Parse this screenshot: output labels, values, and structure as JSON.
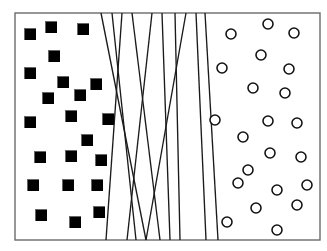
{
  "figure": {
    "title": "Linear separators between two classes",
    "background_color": "#ffffff",
    "frame": {
      "x": 15,
      "y": 13,
      "width": 305,
      "height": 227,
      "stroke_color": "#6b6b6b",
      "fill_color": "#ffffff"
    }
  },
  "chart_data": {
    "type": "scatter",
    "title": "Linear separators between two classes",
    "xlabel": "",
    "ylabel": "",
    "xlim": [
      0,
      327
    ],
    "ylim": [
      0,
      251
    ],
    "grid": false,
    "legend_position": "none",
    "annotations": [],
    "series": [
      {
        "name": "Class A (filled squares)",
        "marker": "square",
        "marker_size": 11,
        "fill_color": "#000000",
        "edge_color": "#000000",
        "count": 22,
        "points": [
          {
            "x": 30,
            "y": 34
          },
          {
            "x": 51,
            "y": 27
          },
          {
            "x": 83,
            "y": 29
          },
          {
            "x": 30,
            "y": 73
          },
          {
            "x": 63,
            "y": 82
          },
          {
            "x": 96,
            "y": 84
          },
          {
            "x": 48,
            "y": 98
          },
          {
            "x": 80,
            "y": 95
          },
          {
            "x": 30,
            "y": 122
          },
          {
            "x": 71,
            "y": 116
          },
          {
            "x": 108,
            "y": 119
          },
          {
            "x": 40,
            "y": 157
          },
          {
            "x": 71,
            "y": 156
          },
          {
            "x": 101,
            "y": 160
          },
          {
            "x": 33,
            "y": 185
          },
          {
            "x": 68,
            "y": 185
          },
          {
            "x": 97,
            "y": 185
          },
          {
            "x": 41,
            "y": 215
          },
          {
            "x": 75,
            "y": 222
          },
          {
            "x": 99,
            "y": 212
          },
          {
            "x": 54,
            "y": 56
          },
          {
            "x": 87,
            "y": 140
          }
        ]
      },
      {
        "name": "Class B (open circles)",
        "marker": "circle",
        "marker_size": 10,
        "fill_color": "#ffffff",
        "edge_color": "#111111",
        "count": 22,
        "points": [
          {
            "x": 231,
            "y": 34
          },
          {
            "x": 268,
            "y": 24
          },
          {
            "x": 294,
            "y": 33
          },
          {
            "x": 261,
            "y": 55
          },
          {
            "x": 222,
            "y": 68
          },
          {
            "x": 289,
            "y": 69
          },
          {
            "x": 253,
            "y": 88
          },
          {
            "x": 285,
            "y": 93
          },
          {
            "x": 215,
            "y": 120
          },
          {
            "x": 268,
            "y": 121
          },
          {
            "x": 297,
            "y": 123
          },
          {
            "x": 243,
            "y": 137
          },
          {
            "x": 270,
            "y": 153
          },
          {
            "x": 301,
            "y": 157
          },
          {
            "x": 238,
            "y": 183
          },
          {
            "x": 277,
            "y": 190
          },
          {
            "x": 297,
            "y": 205
          },
          {
            "x": 256,
            "y": 208
          },
          {
            "x": 227,
            "y": 222
          },
          {
            "x": 277,
            "y": 230
          },
          {
            "x": 248,
            "y": 170
          },
          {
            "x": 307,
            "y": 185
          }
        ]
      }
    ],
    "separators": {
      "name": "Candidate linear separators",
      "count": 10,
      "stroke_color": "#1a1a1a",
      "stroke_width": 1.35,
      "lines": [
        {
          "id": "line-1",
          "x1": 101,
          "y1": 13,
          "x2": 146,
          "y2": 240
        },
        {
          "id": "line-2",
          "x1": 112,
          "y1": 13,
          "x2": 136,
          "y2": 240
        },
        {
          "id": "line-3",
          "x1": 122,
          "y1": 13,
          "x2": 106,
          "y2": 240
        },
        {
          "id": "line-4",
          "x1": 132,
          "y1": 13,
          "x2": 160,
          "y2": 240
        },
        {
          "id": "line-5",
          "x1": 152,
          "y1": 13,
          "x2": 127,
          "y2": 240
        },
        {
          "id": "line-6",
          "x1": 162,
          "y1": 13,
          "x2": 170,
          "y2": 240
        },
        {
          "id": "line-7",
          "x1": 175,
          "y1": 13,
          "x2": 180,
          "y2": 240
        },
        {
          "id": "line-8",
          "x1": 186,
          "y1": 13,
          "x2": 146,
          "y2": 240
        },
        {
          "id": "line-9",
          "x1": 196,
          "y1": 13,
          "x2": 206,
          "y2": 240
        },
        {
          "id": "line-10",
          "x1": 205,
          "y1": 13,
          "x2": 218,
          "y2": 240
        }
      ]
    }
  }
}
